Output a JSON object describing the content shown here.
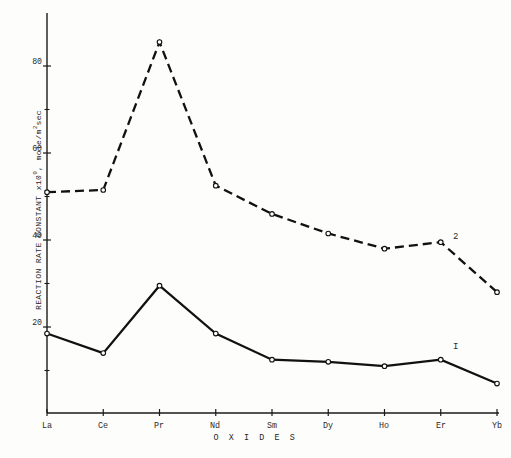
{
  "chart_data": {
    "type": "line",
    "title": "",
    "xlabel": "O X I D E S",
    "ylabel": "REACTION RATE CONSTANT x10⁹, mole/m²sec",
    "ylabel_prefix": "REACTION RATE CONSTANT x10",
    "ylabel_exponent": "9",
    "ylabel_suffix": ", mole/m",
    "ylabel_exponent2": "2",
    "ylabel_tail": "sec",
    "categories": [
      "La",
      "Ce",
      "Pr",
      "Nd",
      "Sm",
      "Dy",
      "Ho",
      "Er",
      "Yb"
    ],
    "ylim": [
      0,
      90
    ],
    "xlim_categories": 9,
    "yticks_major": [
      20,
      40,
      60,
      80
    ],
    "yticks_minor": [
      10,
      30,
      50,
      70
    ],
    "ytick_labels": [
      "20",
      "40",
      "60",
      "80"
    ],
    "grid": false,
    "legend_position": "inline-right",
    "series": [
      {
        "name": "I",
        "label": "I",
        "style": "solid",
        "marker": "open-circle",
        "color": "#111111",
        "values": [
          18.5,
          14.0,
          29.5,
          18.5,
          12.5,
          12.0,
          11.0,
          12.5,
          7.0
        ]
      },
      {
        "name": "2",
        "label": "2",
        "style": "dashed",
        "marker": "open-circle",
        "color": "#111111",
        "values": [
          51.0,
          51.5,
          85.5,
          52.5,
          46.0,
          41.5,
          38.0,
          39.5,
          28.0
        ]
      }
    ]
  },
  "axes": {
    "y_tick_labels": [
      "80",
      "60",
      "40",
      "20"
    ],
    "x_tick_labels": [
      "La",
      "Ce",
      "Pr",
      "Nd",
      "Sm",
      "Dy",
      "Ho",
      "Er",
      "Yb"
    ]
  },
  "annotations": {
    "series_one_label": "I",
    "series_two_label": "2"
  }
}
